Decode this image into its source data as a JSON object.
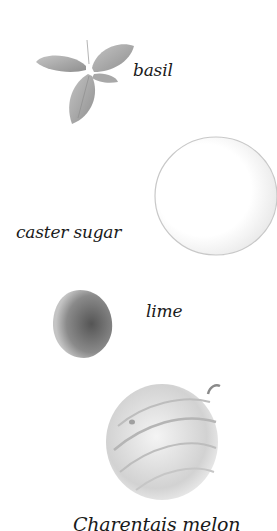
{
  "ingredients": [
    {
      "label": "basil"
    },
    {
      "label": "caster sugar"
    },
    {
      "label": "lime"
    },
    {
      "label": "Charentais melon"
    }
  ],
  "colors": {
    "background": "#ffffff",
    "text": "#1a1a1a",
    "basil": "#9a9a9a",
    "lime": "#7a7a7a",
    "melon": "#cfcfcf",
    "sugar_outline": "#c8c8c8"
  }
}
